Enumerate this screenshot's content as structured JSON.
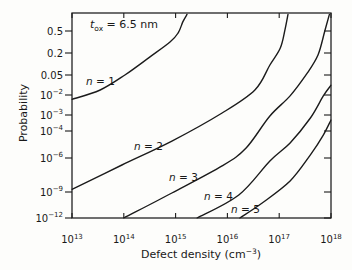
{
  "figure": {
    "background": "#fdfdfb",
    "line_color": "#1b1b1b"
  },
  "chart_data": {
    "type": "line",
    "title": "",
    "annotation": "t_ox = 6.5 nm",
    "annotation_parts": {
      "var": "t",
      "sub": "ox",
      "rest": " = 6.5 nm"
    },
    "xlabel": "Defect density (cm^-3)",
    "xlabel_parts": [
      "Defect density (cm",
      "-3",
      ")"
    ],
    "ylabel": "Probability",
    "x_axis": {
      "scale": "log",
      "min": 10000000000000.0,
      "max": 1e+18,
      "ticks": [
        "10^13",
        "10^14",
        "10^15",
        "10^16",
        "10^17",
        "10^18"
      ]
    },
    "y_axis": {
      "scale": "probability-nonlinear",
      "ticks": [
        {
          "label": "0.5",
          "p": 0.5
        },
        {
          "label": "0.2",
          "p": 0.2
        },
        {
          "label": "0.05",
          "p": 0.05
        },
        {
          "label": "10^-2",
          "p": 0.01
        },
        {
          "label": "10^-3",
          "p": 0.001
        },
        {
          "label": "10^-4",
          "p": 0.0001
        },
        {
          "label": "10^-6",
          "p": 1e-06
        },
        {
          "label": "10^-9",
          "p": 1e-09
        },
        {
          "label": "10^-12",
          "p": 1e-12
        }
      ]
    },
    "grid": false,
    "legend": "inline-curve-labels",
    "series": [
      {
        "name": "n = 1",
        "x": [
          10000000000000.0,
          35000000000000.0,
          105000000000000.0,
          320000000000000.0,
          780000000000000.0,
          1120000000000000.0,
          1380000000000000.0,
          1660000000000000.0
        ],
        "p": [
          0.006,
          0.015,
          0.05,
          0.156,
          0.316,
          0.46,
          0.73,
          1.0
        ]
      },
      {
        "name": "n = 2",
        "x": [
          10000000000000.0,
          92000000000000.0,
          850000000000000.0,
          7900000000000000.0,
          3.4e+16,
          6.6e+16,
          1.05e+17,
          1.29e+17,
          1.48e+17
        ],
        "p": [
          1.7e-09,
          2.4e-07,
          1.8e-05,
          0.00126,
          0.015,
          0.094,
          0.246,
          0.52,
          1.0
        ]
      },
      {
        "name": "n = 3",
        "x": [
          100000000000000.0,
          850000000000000.0,
          7900000000000000.0,
          2.3e+16,
          6.6e+16,
          1.62e+17,
          3.5e+17,
          5.6e+17,
          7.6e+17,
          9.3e+17
        ],
        "p": [
          1e-12,
          7.7e-10,
          2e-07,
          5.5e-06,
          0.00087,
          0.009,
          0.057,
          0.176,
          0.5,
          1.0
        ]
      },
      {
        "name": "n = 4",
        "x": [
          2600000000000000.0,
          1.66e+16,
          6.6e+16,
          1.62e+17,
          4e+17,
          7.1e+17,
          1e+18
        ],
        "p": [
          1e-12,
          4.5e-10,
          5.4e-07,
          1.3e-05,
          0.00065,
          0.009,
          0.022
        ]
      },
      {
        "name": "n = 5",
        "x": [
          1.74e+16,
          4.7e+16,
          1.62e+17,
          4e+17,
          7.1e+17,
          1e+18
        ],
        "p": [
          1e-12,
          5.4e-11,
          9.3e-09,
          1.7e-06,
          5e-05,
          0.00049
        ]
      }
    ],
    "layout": {
      "canvas": {
        "w": 352,
        "h": 270
      },
      "plot": {
        "left": 72,
        "top": 13,
        "right": 331,
        "bottom": 218
      },
      "y_tick_px": [
        31,
        53,
        75,
        95,
        115,
        131,
        158,
        192,
        218
      ],
      "x_tick_label_baseline": 243,
      "xlabel_px": [
        201,
        258
      ],
      "ylabel_px": [
        27,
        113
      ],
      "annotation_px": [
        90,
        28
      ],
      "series_label_px": [
        [
          86,
          85
        ],
        [
          134,
          150
        ],
        [
          169,
          181
        ],
        [
          204,
          200
        ],
        [
          231,
          213
        ]
      ],
      "tick_len_axis_lr": 7,
      "tick_len_axis_tb": 5
    }
  }
}
